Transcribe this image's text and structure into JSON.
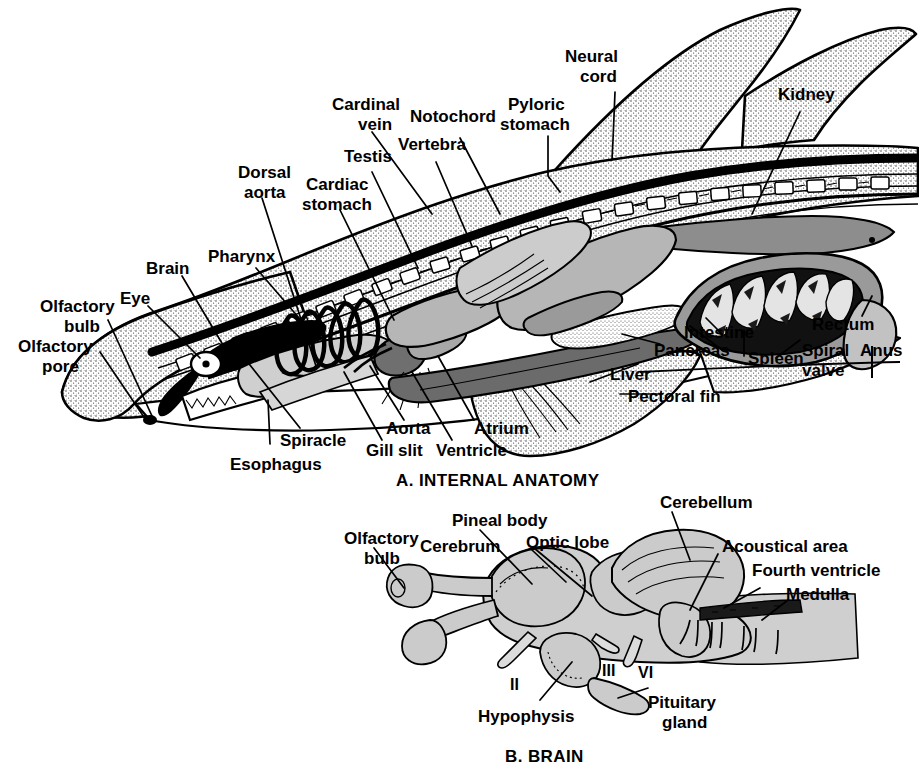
{
  "figure": {
    "title_a": "A. INTERNAL ANATOMY",
    "title_b": "B. BRAIN"
  },
  "panel_a": {
    "caption": "A. INTERNAL ANATOMY",
    "labels": [
      {
        "id": "neural-cord",
        "text": "Neural\ncord",
        "line1": "Neural",
        "line2": "cord"
      },
      {
        "id": "kidney",
        "text": "Kidney",
        "line1": "Kidney",
        "line2": ""
      },
      {
        "id": "pyloric-stomach",
        "text": "Pyloric\nstomach",
        "line1": "Pyloric",
        "line2": "stomach"
      },
      {
        "id": "notochord",
        "text": "Notochord",
        "line1": "Notochord",
        "line2": ""
      },
      {
        "id": "cardinal-vein",
        "text": "Cardinal\nvein",
        "line1": "Cardinal",
        "line2": "vein"
      },
      {
        "id": "vertebra",
        "text": "Vertebra",
        "line1": "Vertebra",
        "line2": ""
      },
      {
        "id": "testis",
        "text": "Testis",
        "line1": "Testis",
        "line2": ""
      },
      {
        "id": "dorsal-aorta",
        "text": "Dorsal\naorta",
        "line1": "Dorsal",
        "line2": "aorta"
      },
      {
        "id": "cardiac-stomach",
        "text": "Cardiac\nstomach",
        "line1": "Cardiac",
        "line2": "stomach"
      },
      {
        "id": "pharynx",
        "text": "Pharynx",
        "line1": "Pharynx",
        "line2": ""
      },
      {
        "id": "brain",
        "text": "Brain",
        "line1": "Brain",
        "line2": ""
      },
      {
        "id": "eye",
        "text": "Eye",
        "line1": "Eye",
        "line2": ""
      },
      {
        "id": "olfactory-bulb",
        "text": "Olfactory\nbulb",
        "line1": "Olfactory",
        "line2": "bulb"
      },
      {
        "id": "olfactory-pore",
        "text": "Olfactory\npore",
        "line1": "Olfactory",
        "line2": "pore"
      },
      {
        "id": "spiracle",
        "text": "Spiracle",
        "line1": "Spiracle",
        "line2": ""
      },
      {
        "id": "esophagus",
        "text": "Esophagus",
        "line1": "Esophagus",
        "line2": ""
      },
      {
        "id": "gill-slit",
        "text": "Gill slit",
        "line1": "Gill slit",
        "line2": ""
      },
      {
        "id": "aorta",
        "text": "Aorta",
        "line1": "Aorta",
        "line2": ""
      },
      {
        "id": "ventricle",
        "text": "Ventricle",
        "line1": "Ventricle",
        "line2": ""
      },
      {
        "id": "atrium",
        "text": "Atrium",
        "line1": "Atrium",
        "line2": ""
      },
      {
        "id": "liver",
        "text": "Liver",
        "line1": "Liver",
        "line2": ""
      },
      {
        "id": "pectoral-fin",
        "text": "Pectoral fin",
        "line1": "Pectoral fin",
        "line2": ""
      },
      {
        "id": "pancreas",
        "text": "Pancreas",
        "line1": "Pancreas",
        "line2": ""
      },
      {
        "id": "intestine",
        "text": "Intestine",
        "line1": "Intestine",
        "line2": ""
      },
      {
        "id": "spleen",
        "text": "Spleen",
        "line1": "Spleen",
        "line2": ""
      },
      {
        "id": "spiral-valve",
        "text": "Spiral\nvalve",
        "line1": "Spiral",
        "line2": "valve"
      },
      {
        "id": "rectum",
        "text": "Rectum",
        "line1": "Rectum",
        "line2": ""
      },
      {
        "id": "anus",
        "text": "Anus",
        "line1": "Anus",
        "line2": ""
      }
    ]
  },
  "panel_b": {
    "caption": "B. BRAIN",
    "labels": [
      {
        "id": "cerebellum",
        "line1": "Cerebellum",
        "line2": ""
      },
      {
        "id": "pineal-body",
        "line1": "Pineal body",
        "line2": ""
      },
      {
        "id": "optic-lobe",
        "line1": "Optic lobe",
        "line2": ""
      },
      {
        "id": "olfactory-bulb-b",
        "line1": "Olfactory",
        "line2": "bulb"
      },
      {
        "id": "cerebrum",
        "line1": "Cerebrum",
        "line2": ""
      },
      {
        "id": "acoustical-area",
        "line1": "Acoustical area",
        "line2": ""
      },
      {
        "id": "fourth-ventricle",
        "line1": "Fourth ventricle",
        "line2": ""
      },
      {
        "id": "medulla",
        "line1": "Medulla",
        "line2": ""
      },
      {
        "id": "hypophysis",
        "line1": "Hypophysis",
        "line2": ""
      },
      {
        "id": "pituitary-gland",
        "line1": "Pituitary",
        "line2": "gland"
      }
    ],
    "nerves": [
      {
        "id": "nerve-ii",
        "text": "II"
      },
      {
        "id": "nerve-iii",
        "text": "III"
      },
      {
        "id": "nerve-vi",
        "text": "VI"
      }
    ]
  },
  "colors": {
    "ink": "#000000",
    "paper": "#ffffff",
    "stipple_light": "#e8e8e8",
    "organ_mid": "#b9b9b9",
    "organ_dark": "#8a8a8a",
    "organ_darkest": "#5a5a5a"
  }
}
